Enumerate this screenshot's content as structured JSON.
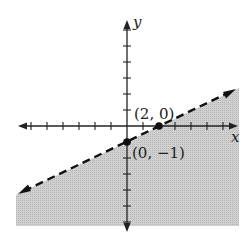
{
  "figure": {
    "type": "linear-inequality-graph",
    "inequality": "y < x/2 - 1",
    "boundary_line": {
      "style": "dashed",
      "slope": 0.5,
      "intercept": -1
    },
    "shading": "below",
    "colors": {
      "shade": "#c8c8c8",
      "axis": "#222222",
      "line": "#111111",
      "background": "#ffffff"
    }
  },
  "axes": {
    "x_label": "x",
    "y_label": "y",
    "x_range": [
      -7,
      7
    ],
    "y_range": [
      -6,
      6
    ],
    "tick_spacing": 1
  },
  "points": [
    {
      "label": "(2, 0)",
      "x": 2,
      "y": 0
    },
    {
      "label": "(0, −1)",
      "x": 0,
      "y": -1
    }
  ]
}
